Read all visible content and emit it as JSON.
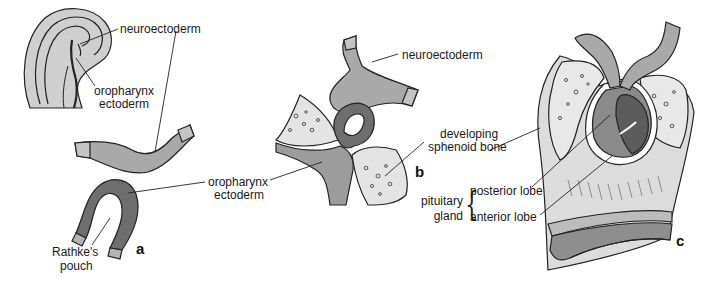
{
  "figure": {
    "panels": [
      {
        "id": "a",
        "label": "a"
      },
      {
        "id": "b",
        "label": "b"
      },
      {
        "id": "c",
        "label": "c"
      }
    ],
    "labels": {
      "a_neuroectoderm": "neuroectoderm",
      "a_oropharynx_line1": "oropharynx",
      "a_oropharynx_line2": "ectoderm",
      "rathke_line1": "Rathke's",
      "rathke_line2": "pouch",
      "b_neuroectoderm": "neuroectoderm",
      "mid_oropharynx_line1": "oropharynx",
      "mid_oropharynx_line2": "ectoderm",
      "sphenoid_line1": "developing",
      "sphenoid_line2": "sphenoid bone",
      "pituitary_line1": "pituitary",
      "pituitary_line2": "gland",
      "posterior_lobe": "posterior lobe",
      "anterior_lobe": "anterior lobe"
    },
    "colors": {
      "neuroectoderm": "#a9a9a9",
      "oropharynx_ectoderm": "#6e6e6e",
      "bone": "#e4e4e4",
      "tissue_light": "#d8d8d8",
      "outline": "#1e1e1e",
      "tip": "#c4c4c4"
    }
  }
}
